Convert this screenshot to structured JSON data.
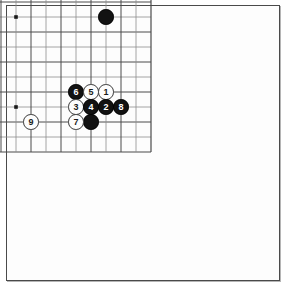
{
  "board": {
    "type": "go-board",
    "size": 19,
    "cell_px": 15,
    "origin_x": 16,
    "origin_y": 17,
    "line_color": "#4a4a4a",
    "minor_line_color": "#8d8d8d",
    "board_color": "#fdfdfd",
    "border_color": "#4a4a4a",
    "star_points": [
      [
        3,
        3
      ],
      [
        9,
        3
      ],
      [
        15,
        3
      ],
      [
        3,
        9
      ],
      [
        9,
        9
      ],
      [
        15,
        9
      ],
      [
        3,
        15
      ],
      [
        9,
        15
      ],
      [
        15,
        15
      ]
    ]
  },
  "stones": [
    {
      "name": "white-stone-upper-left",
      "color": "white",
      "col": 2,
      "row": 2,
      "label": ""
    },
    {
      "name": "black-stone-upper-right",
      "color": "black",
      "col": 14,
      "row": 2,
      "label": ""
    },
    {
      "name": "black-stone-right-side",
      "color": "black",
      "col": 15,
      "row": 9,
      "label": ""
    },
    {
      "name": "white-stone-lower-left",
      "color": "white",
      "col": 2,
      "row": 15,
      "label": ""
    },
    {
      "name": "black-stone-corner-plain",
      "color": "black",
      "col": 14,
      "row": 16,
      "label": ""
    },
    {
      "name": "move-stone-6",
      "color": "black",
      "col": 13,
      "row": 14,
      "label": "6"
    },
    {
      "name": "move-stone-5",
      "color": "white",
      "col": 14,
      "row": 14,
      "label": "5"
    },
    {
      "name": "move-stone-1",
      "color": "white",
      "col": 15,
      "row": 14,
      "label": "1"
    },
    {
      "name": "move-stone-3",
      "color": "white",
      "col": 13,
      "row": 15,
      "label": "3"
    },
    {
      "name": "move-stone-4",
      "color": "black",
      "col": 14,
      "row": 15,
      "label": "4"
    },
    {
      "name": "move-stone-2",
      "color": "black",
      "col": 15,
      "row": 15,
      "label": "2"
    },
    {
      "name": "move-stone-8",
      "color": "black",
      "col": 16,
      "row": 15,
      "label": "8"
    },
    {
      "name": "move-stone-7",
      "color": "white",
      "col": 13,
      "row": 16,
      "label": "7"
    },
    {
      "name": "move-stone-9",
      "color": "white",
      "col": 10,
      "row": 16,
      "label": "9"
    }
  ],
  "move_labels": [
    "1",
    "2",
    "3",
    "4",
    "5",
    "6",
    "7",
    "8",
    "9"
  ]
}
